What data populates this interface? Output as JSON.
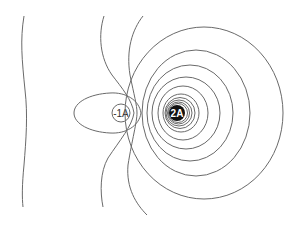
{
  "diagram": {
    "type": "contour-map",
    "sources": [
      {
        "label": "-1A",
        "style": "outlined",
        "cx": 120,
        "cy": 113
      },
      {
        "label": "2A",
        "style": "filled",
        "cx": 177,
        "cy": 113
      }
    ],
    "colors": {
      "line": "#6a6a6a",
      "fill_dark": "#111111",
      "background": "#ffffff"
    }
  }
}
